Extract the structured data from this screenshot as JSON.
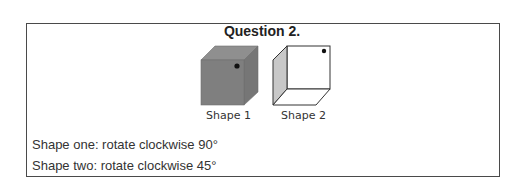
{
  "question": {
    "title": "Question 2.",
    "shapes": [
      {
        "label": "Shape 1",
        "fill": "#7f7f7f",
        "top_fill": "#8f8f8f",
        "side_fill": "#767676"
      },
      {
        "label": "Shape 2",
        "fill": "#ffffff",
        "side_fill": "#c8c8c8"
      }
    ],
    "instructions": [
      "Shape one: rotate clockwise 90°",
      "Shape two: rotate clockwise 45°"
    ]
  }
}
